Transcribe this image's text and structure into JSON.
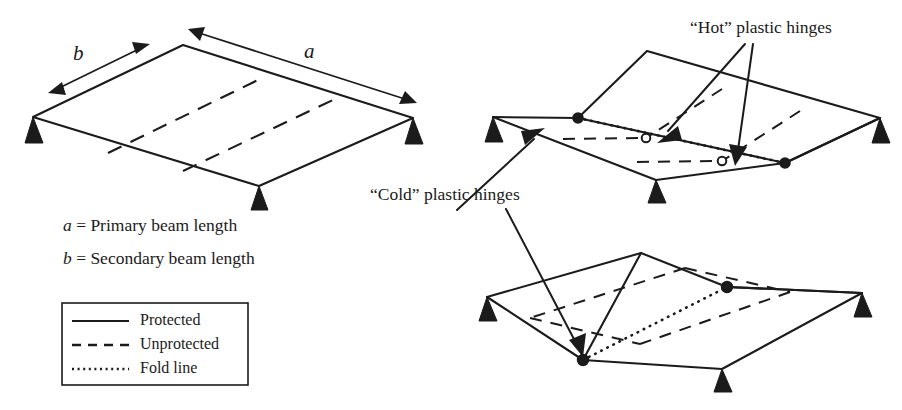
{
  "figure": {
    "title_present": false,
    "background_color": "#ffffff",
    "line_color": "#1b1b1b"
  },
  "dimensions": {
    "a_label": "a",
    "b_label": "b"
  },
  "definitions": [
    {
      "symbol": "a",
      "equals": "=",
      "text": "Primary beam length"
    },
    {
      "symbol": "b",
      "equals": "=",
      "text": "Secondary beam length"
    }
  ],
  "legend": {
    "items": [
      {
        "label": "Protected",
        "style": "solid"
      },
      {
        "label": "Unprotected",
        "style": "dashed"
      },
      {
        "label": "Fold line",
        "style": "dotted"
      }
    ]
  },
  "annotations": [
    {
      "id": "hot-hinges",
      "label": "“Hot” plastic hinges"
    },
    {
      "id": "cold-hinges",
      "label": "“Cold” plastic hinges"
    }
  ],
  "panels": [
    {
      "id": "undeformed-slab",
      "supports": 3,
      "unprotected_beams": 2,
      "fold_lines": 0
    },
    {
      "id": "folded-slab-top",
      "supports": 3,
      "unprotected_beams": 2,
      "fold_lines": 1,
      "cold_hinges": 2,
      "hot_hinges": 2
    },
    {
      "id": "folded-slab-bottom",
      "supports": 3,
      "unprotected_beams": 2,
      "fold_lines": 1,
      "cold_hinges": 2,
      "hot_hinges": 0
    }
  ]
}
